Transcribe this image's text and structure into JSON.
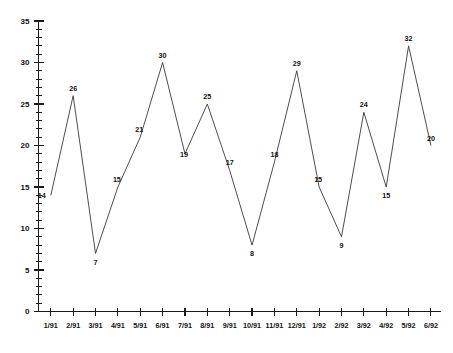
{
  "chart_data": {
    "type": "line",
    "title": "",
    "subtitle": "",
    "xlabel": "",
    "ylabel": "",
    "categories": [
      "1/91",
      "2/91",
      "3/91",
      "4/91",
      "5/91",
      "6/91",
      "7/91",
      "8/91",
      "9/91",
      "10/91",
      "11/91",
      "12/91",
      "1/92",
      "2/92",
      "3/92",
      "4/92",
      "5/92",
      "6/92"
    ],
    "values": [
      14,
      26,
      7,
      15,
      21,
      30,
      19,
      25,
      17,
      8,
      18,
      29,
      15,
      9,
      24,
      15,
      32,
      20
    ],
    "point_labels": [
      "14",
      "26",
      "7",
      "15",
      "21",
      "30",
      "19",
      "25",
      "17",
      "8",
      "18",
      "29",
      "15",
      "9",
      "24",
      "15",
      "32",
      "20"
    ],
    "ylim": [
      0,
      35
    ],
    "y_major_ticks": [
      0,
      5,
      10,
      15,
      20,
      25,
      30,
      35
    ],
    "y_major_tick_labels": [
      "0",
      "5",
      "10",
      "15",
      "20",
      "25",
      "30",
      "35"
    ],
    "y_minor_tick_step": 1,
    "grid": false,
    "legend": null,
    "legend_position": "none",
    "series": [
      {
        "name": "",
        "values": [
          14,
          26,
          7,
          15,
          21,
          30,
          19,
          25,
          17,
          8,
          18,
          29,
          15,
          9,
          24,
          15,
          32,
          20
        ],
        "color": "#3a3a3a"
      }
    ],
    "colors": {
      "line": "#3a3a3a",
      "axis": "#1a1a1a",
      "text": "#111111",
      "background": "#ffffff"
    },
    "label_offsets": [
      {
        "dx": -9,
        "dy": 3
      },
      {
        "dx": 0,
        "dy": -5
      },
      {
        "dx": 0,
        "dy": 12
      },
      {
        "dx": -1,
        "dy": -5
      },
      {
        "dx": -1,
        "dy": -5
      },
      {
        "dx": 0,
        "dy": -5
      },
      {
        "dx": -1,
        "dy": 3
      },
      {
        "dx": 0,
        "dy": -5
      },
      {
        "dx": 0,
        "dy": -5
      },
      {
        "dx": 0,
        "dy": 11
      },
      {
        "dx": 0,
        "dy": -5
      },
      {
        "dx": 0,
        "dy": -5
      },
      {
        "dx": -1,
        "dy": -5
      },
      {
        "dx": 0,
        "dy": 11
      },
      {
        "dx": 0,
        "dy": -5
      },
      {
        "dx": 0,
        "dy": 11
      },
      {
        "dx": 0,
        "dy": -5
      },
      {
        "dx": 0,
        "dy": -5
      }
    ]
  }
}
